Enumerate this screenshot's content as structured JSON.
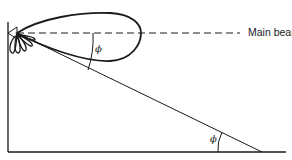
{
  "diagram": {
    "type": "antenna-radiation-geometry",
    "labels": {
      "main_beam": "Main bean",
      "angle_upper": "ϕ",
      "angle_lower": "ϕ"
    },
    "elements": [
      "vertical mast line",
      "horizontal ground line",
      "antenna at top of mast",
      "main lobe (teardrop) radiation pattern",
      "side lobes below antenna",
      "dashed main beam axis",
      "slant line from antenna to ground",
      "angle arc between beam axis and slant line",
      "angle arc between slant line and ground"
    ],
    "colors": {
      "stroke": "#1a1a1a",
      "background": "#ffffff"
    }
  }
}
